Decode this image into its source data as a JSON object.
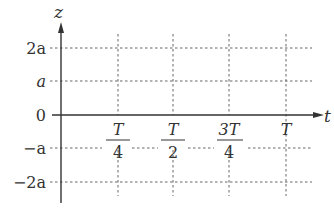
{
  "diagram": {
    "vertical_axis_label": "z",
    "horizontal_axis_label": "t",
    "y_ticks": [
      {
        "label": "2a",
        "value": 2
      },
      {
        "label": "a",
        "value": 1
      },
      {
        "label": "0",
        "value": 0
      },
      {
        "label": "−a",
        "value": -1
      },
      {
        "label": "−2a",
        "value": -2
      }
    ],
    "x_ticks": [
      {
        "num": "T",
        "den": "4"
      },
      {
        "num": "T",
        "den": "2"
      },
      {
        "num": "3T",
        "den": "4"
      },
      {
        "num": "T",
        "den": ""
      }
    ],
    "grid": "dotted",
    "colors": {
      "axis": "#333333",
      "grid": "#666666",
      "text": "#333333"
    }
  }
}
